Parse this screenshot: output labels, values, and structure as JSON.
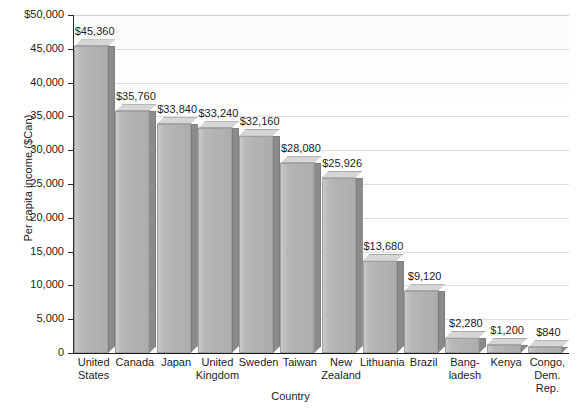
{
  "chart_data": {
    "type": "bar",
    "title": "",
    "xlabel": "Country",
    "ylabel": "Per capita income ($Can)",
    "ylim": [
      0,
      50000
    ],
    "ytick_step": 5000,
    "grid": true,
    "legend": "none",
    "style": "3d-bar",
    "categories": [
      "United States",
      "Canada",
      "Japan",
      "United Kingdom",
      "Sweden",
      "Taiwan",
      "New Zealand",
      "Lithuania",
      "Brazil",
      "Bangladesh",
      "Kenya",
      "Congo, Dem. Rep."
    ],
    "values": [
      45360,
      35760,
      33840,
      33240,
      32160,
      28080,
      25926,
      13680,
      9120,
      2280,
      1200,
      840
    ],
    "value_labels": [
      "$45,360",
      "$35,760",
      "$33,840",
      "$33,240",
      "$32,160",
      "$28,080",
      "$25,926",
      "$13,680",
      "$9,120",
      "$2,280",
      "$1,200",
      "$840"
    ],
    "category_label_lines": [
      [
        "United",
        "States"
      ],
      [
        "Canada"
      ],
      [
        "Japan"
      ],
      [
        "United",
        "Kingdom"
      ],
      [
        "Sweden"
      ],
      [
        "Taiwan"
      ],
      [
        "New",
        "Zealand"
      ],
      [
        "Lithuania"
      ],
      [
        "Brazil"
      ],
      [
        "Bang-",
        "ladesh"
      ],
      [
        "Kenya"
      ],
      [
        "Congo,",
        "Dem.",
        "Rep."
      ]
    ],
    "ytick_labels": [
      "$50,000",
      "45,000",
      "40,000",
      "35,000",
      "30,000",
      "25,000",
      "20,000",
      "15,000",
      "10,000",
      "5,000",
      "0"
    ],
    "ytick_values": [
      50000,
      45000,
      40000,
      35000,
      30000,
      25000,
      20000,
      15000,
      10000,
      5000,
      0
    ]
  },
  "colors": {
    "bar_front": "#b4b4b4",
    "bar_side": "#8b8b8b",
    "bar_top": "#d6d6d6",
    "axis": "#1a1a1a",
    "gridline": "#dededd",
    "text": "#1d1d1d",
    "background": "#ffffff"
  }
}
